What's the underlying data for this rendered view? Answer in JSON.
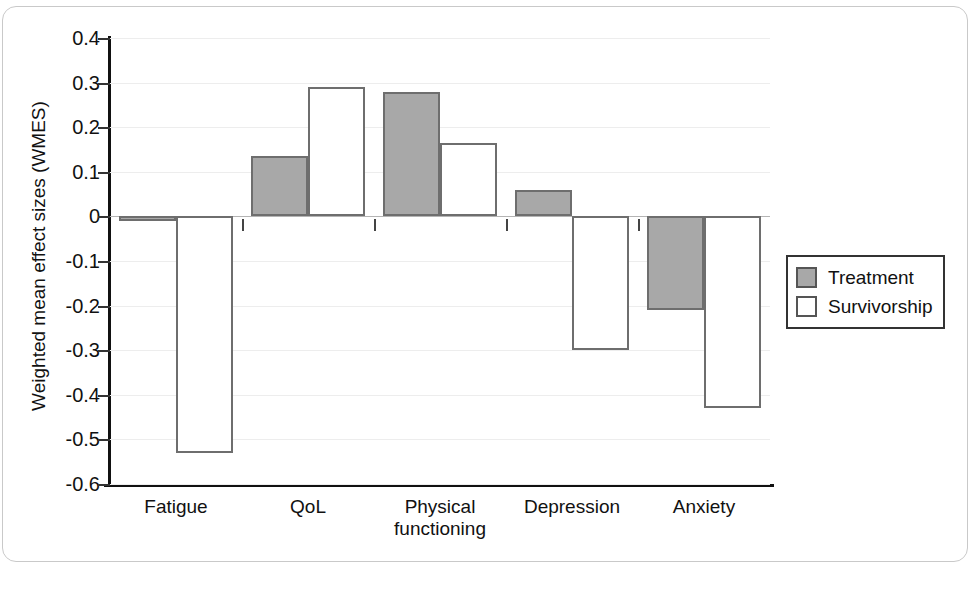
{
  "chart_data": {
    "type": "bar",
    "title": "",
    "xlabel": "",
    "ylabel": "Weighted mean effect sizes (WMES)",
    "ylim": [
      -0.6,
      0.4
    ],
    "ytick_labels": [
      "0.4",
      "0.3",
      "0.2",
      "0.1",
      "0",
      "-0.1",
      "-0.2",
      "-0.3",
      "-0.4",
      "-0.5",
      "-0.6"
    ],
    "ytick_values": [
      0.4,
      0.3,
      0.2,
      0.1,
      0,
      -0.1,
      -0.2,
      -0.3,
      -0.4,
      -0.5,
      -0.6
    ],
    "grid": true,
    "legend_position": "right",
    "categories": [
      "Fatigue",
      "QoL",
      "Physical functioning",
      "Depression",
      "Anxiety"
    ],
    "category_lines": [
      [
        "Fatigue"
      ],
      [
        "QoL"
      ],
      [
        "Physical",
        "functioning"
      ],
      [
        "Depression"
      ],
      [
        "Anxiety"
      ]
    ],
    "series": [
      {
        "name": "Treatment",
        "color": "#a8a8a8",
        "values": [
          -0.01,
          0.135,
          0.28,
          0.06,
          -0.21
        ]
      },
      {
        "name": "Survivorship",
        "color": "#ffffff",
        "values": [
          -0.53,
          0.29,
          0.165,
          -0.3,
          -0.43
        ]
      }
    ]
  },
  "legend": {
    "items": [
      {
        "label": "Treatment",
        "swatch": "treatment"
      },
      {
        "label": "Survivorship",
        "swatch": "survivorship"
      }
    ]
  },
  "colors": {
    "treatment_fill": "#a8a8a8",
    "survivorship_fill": "#ffffff",
    "bar_outline": "#6e6e6e",
    "axis": "#111111",
    "gridline": "#ededed",
    "zero_line": "#b4b4b4"
  }
}
